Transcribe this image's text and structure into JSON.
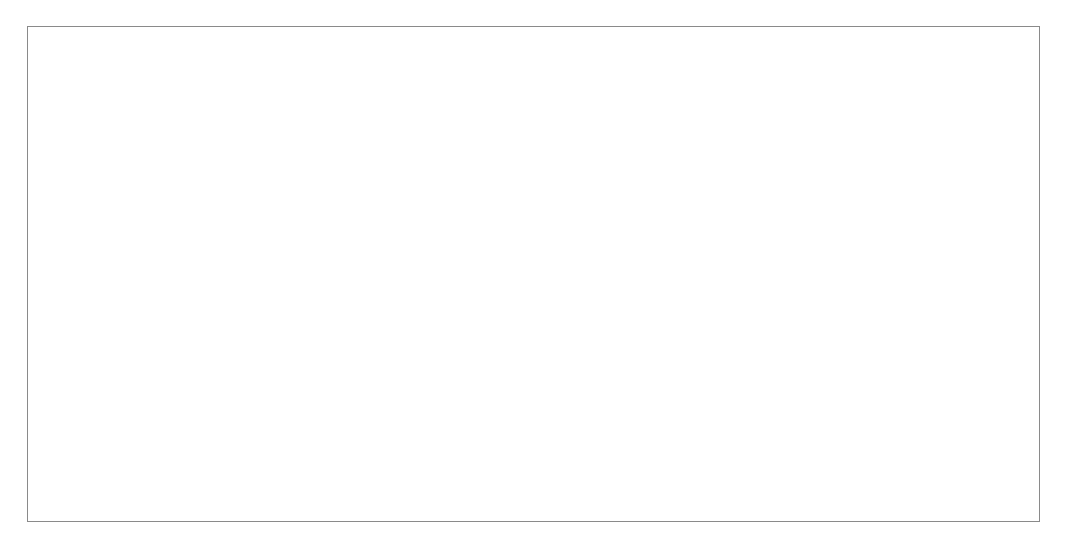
{
  "figure": {
    "domain": "Map",
    "kind": "global-ocean-vector-contour-map",
    "background_color": "#ffffff",
    "frame": {
      "visible": true,
      "color": "#8a8a8a",
      "line_width_px": 1,
      "x": 27,
      "y": 26,
      "width": 1013,
      "height": 496
    },
    "title": "",
    "subtitle": "",
    "caption": "",
    "legend": {
      "visible": false,
      "entries": []
    },
    "axes": {
      "visible": false,
      "tick_labels": [],
      "xlabel": "",
      "ylabel": ""
    },
    "colorbar": {
      "visible": false
    }
  },
  "projection": {
    "name": "Mollweide",
    "shape": "ellipse",
    "center_x": 534,
    "center_y": 272,
    "semi_axis_x": 494,
    "semi_axis_y": 244,
    "outline_color": "#333333",
    "outline_width_px": 1.1,
    "graticule": {
      "visible": false,
      "meridian_step_deg": 0,
      "parallel_step_deg": 0
    },
    "central_meridian_deg": -30,
    "lon_range_deg": [
      -210,
      150
    ],
    "lat_range_deg": [
      -90,
      90
    ]
  },
  "layers": {
    "land": {
      "name": "land-mask",
      "fill_color": "#000000",
      "stroke_color": "#000000",
      "description": "Continents and major islands rendered as solid black silhouettes"
    },
    "ocean": {
      "name": "ocean-background",
      "fill_color": "#ffffff"
    },
    "vectors": {
      "name": "vector-field",
      "style": "arrow",
      "color": "#4a4a4a",
      "grid_spacing_px": 8.2,
      "max_length_px": 9,
      "head_size_px": 2.2,
      "line_width_px": 0.55,
      "description": "Dense regular grid of small arrows over ocean showing surface wind / current direction and magnitude"
    },
    "contours": {
      "name": "contour-lines",
      "color": "#555555",
      "line_width_px": 0.7,
      "filled": false,
      "description": "Thin closed and zonally elongated contour lines over the ocean"
    }
  },
  "chart_data": {
    "type": "map",
    "title": "",
    "xlabel": "",
    "ylabel": "",
    "projection": "Mollweide",
    "grid": false,
    "legend": false,
    "flow_regimes": [
      {
        "name": "northern-polar-easterlies",
        "lat_deg": 72,
        "direction_deg": 260,
        "strength": 0.45
      },
      {
        "name": "north-midlatitude-westerlies",
        "lat_deg": 48,
        "direction_deg": 80,
        "strength": 0.75
      },
      {
        "name": "north-subtropical-highs",
        "lat_deg": 28,
        "direction_deg": 200,
        "strength": 0.35
      },
      {
        "name": "north-east-trades",
        "lat_deg": 12,
        "direction_deg": 255,
        "strength": 0.55
      },
      {
        "name": "itcz-convergence",
        "lat_deg": 3,
        "direction_deg": 270,
        "strength": 0.18
      },
      {
        "name": "south-east-trades",
        "lat_deg": -12,
        "direction_deg": 285,
        "strength": 0.55
      },
      {
        "name": "south-subtropical-highs",
        "lat_deg": -28,
        "direction_deg": 340,
        "strength": 0.35
      },
      {
        "name": "southern-ocean-westerlies",
        "lat_deg": -50,
        "direction_deg": 85,
        "strength": 1.0
      },
      {
        "name": "antarctic-coastal-easterlies",
        "lat_deg": -70,
        "direction_deg": 255,
        "strength": 0.5
      }
    ]
  }
}
